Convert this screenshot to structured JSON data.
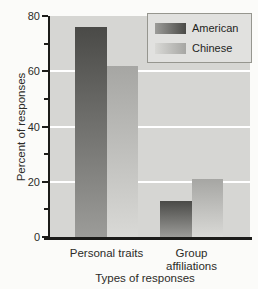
{
  "chart_data": {
    "type": "bar",
    "title": "",
    "xlabel": "Types of responses",
    "ylabel": "Percent of responses",
    "categories": [
      "Personal traits",
      "Group affiliations"
    ],
    "series": [
      {
        "name": "American",
        "values": [
          76,
          13
        ],
        "color_top": "#4a4a47",
        "color_bottom": "#9c9c99"
      },
      {
        "name": "Chinese",
        "values": [
          62,
          21
        ],
        "color_top": "#a6a6a3",
        "color_bottom": "#d9d9d6"
      }
    ],
    "ylim": [
      0,
      80
    ],
    "ytick_major": [
      0,
      20,
      40,
      60,
      80
    ],
    "ytick_minor": [
      10,
      30,
      50,
      70
    ],
    "gridlines": [
      20,
      40,
      60
    ],
    "grid_color": "#ffffff",
    "plot_bg": "#d6d6d3",
    "legend_position": "top-right",
    "legend": {
      "items": [
        "American",
        "Chinese"
      ]
    }
  }
}
